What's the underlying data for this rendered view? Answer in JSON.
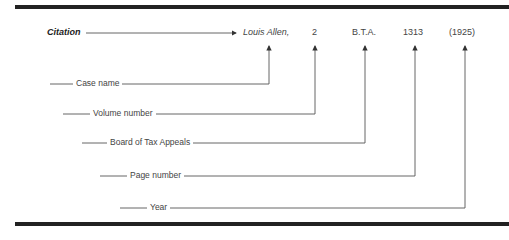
{
  "title": "Citation",
  "citation_parts": [
    {
      "text": "Louis Allen,",
      "style": "italic",
      "label": "Case name"
    },
    {
      "text": "2",
      "style": "normal",
      "label": "Volume number"
    },
    {
      "text": "B.T.A.",
      "style": "normal",
      "label": "Board of Tax Appeals"
    },
    {
      "text": "1313",
      "style": "normal",
      "label": "Page number"
    },
    {
      "text": "(1925)",
      "style": "normal",
      "label": "Year"
    }
  ],
  "colors": {
    "rule": "#222222",
    "line": "#555555",
    "text": "#444444"
  }
}
